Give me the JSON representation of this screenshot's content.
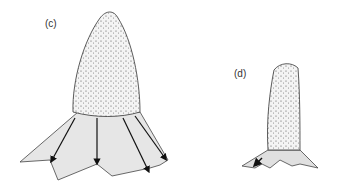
{
  "figure": {
    "panels": [
      {
        "id": "c",
        "label": "(c)"
      },
      {
        "id": "d",
        "label": "(d)"
      }
    ]
  }
}
